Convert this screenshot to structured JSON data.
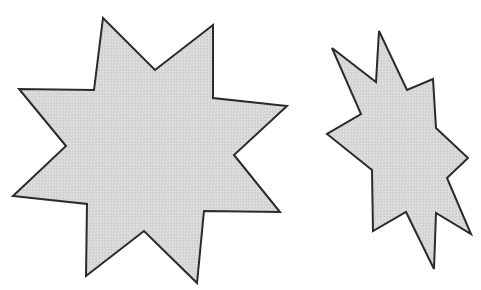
{
  "figure": {
    "width": 481,
    "height": 290,
    "background": "#ffffff"
  },
  "shapes": [
    {
      "name": "large-eight-point-star",
      "type": "polygon",
      "points": "103,18 155,70 213,25 213,98 287,106 234,155 280,212 204,211 197,283 144,231 86,276 87,204 13,196 66,146 19,89 94,90",
      "fill": "#d6d6d6",
      "stroke": "#2b2b2b"
    },
    {
      "name": "small-irregular-star",
      "type": "polygon",
      "points": "332,48 376,82 379,31 407,90 433,79 436,128 468,158 447,178 471,234 436,213 434,269 406,212 373,231 372,170 327,134 361,114",
      "fill": "#d6d6d6",
      "stroke": "#2b2b2b"
    }
  ]
}
